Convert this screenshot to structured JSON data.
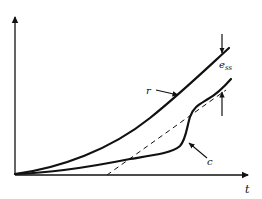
{
  "diagram": {
    "title": "",
    "axes": {
      "x_label": "t",
      "y_label": ""
    },
    "curves": [
      {
        "id": "r",
        "label": "r",
        "style": "solid",
        "meaning": "reference input"
      },
      {
        "id": "c",
        "label": "c",
        "style": "solid",
        "meaning": "output response"
      },
      {
        "id": "asymptote",
        "label": "",
        "style": "dashed",
        "meaning": "steady-state asymptote of output"
      }
    ],
    "annotations": {
      "error_label_main": "e",
      "error_label_sub": "ss",
      "r_label": "r",
      "c_label": "c"
    },
    "colors": {
      "ink": "#111111",
      "background": "#ffffff"
    }
  }
}
